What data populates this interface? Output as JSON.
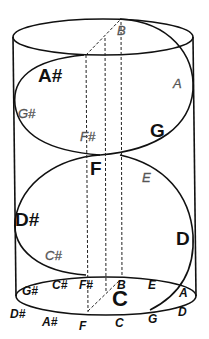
{
  "diagram": {
    "type": "cylinder helix of pitch classes",
    "curve_labels": {
      "top": {
        "B": "B",
        "A_sharp": "A#",
        "A": "A",
        "G_sharp": "G#",
        "F_sharp": "F#",
        "G": "G"
      },
      "middle": {
        "F": "F",
        "E": "E",
        "D_sharp": "D#",
        "C_sharp": "C#",
        "D": "D"
      },
      "base_inner": {
        "G_sharp": "G#",
        "C_sharp": "C#",
        "F_sharp": "F#",
        "B": "B",
        "E": "E",
        "A": "A",
        "C": "C"
      },
      "base_outer": {
        "D_sharp": "D#",
        "A_sharp": "A#",
        "F": "F",
        "C": "C",
        "G": "G",
        "D": "D"
      }
    },
    "colors": {
      "stroke": "#111111",
      "label": "#111111",
      "faint_label": "#555555"
    }
  }
}
